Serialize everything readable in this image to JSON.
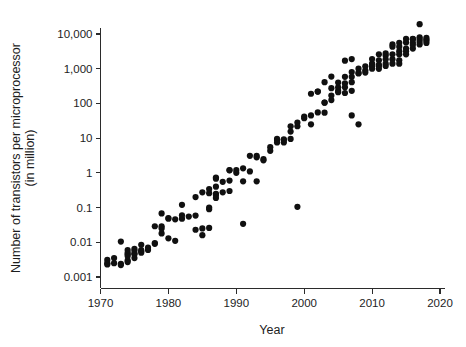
{
  "chart_data": {
    "type": "scatter",
    "title": "",
    "xlabel": "Year",
    "ylabel_line1": "Number of transistors per microprocessor",
    "ylabel_line2": "(in million)",
    "xlim": [
      1970,
      2020
    ],
    "ylim": [
      0.001,
      10000
    ],
    "yscale": "log",
    "xscale": "linear",
    "grid": false,
    "legend": null,
    "xticks": [
      1970,
      1980,
      1990,
      2000,
      2010,
      2020
    ],
    "xtick_labels": [
      "1970",
      "1980",
      "1990",
      "2000",
      "2010",
      "2020"
    ],
    "yticks": [
      0.001,
      0.01,
      0.1,
      1,
      10,
      100,
      1000,
      10000
    ],
    "ytick_labels": [
      "0.001",
      "0.01",
      "0.1",
      "1",
      "10",
      "100",
      "1,000",
      "10,000"
    ],
    "marker": "circle",
    "marker_color": "#101010",
    "marker_size": 3.1,
    "points": [
      [
        1971,
        0.0023
      ],
      [
        1971,
        0.0025
      ],
      [
        1971,
        0.0031
      ],
      [
        1972,
        0.0035
      ],
      [
        1972,
        0.0025
      ],
      [
        1973,
        0.0022
      ],
      [
        1973,
        0.0024
      ],
      [
        1973,
        0.0105
      ],
      [
        1974,
        0.0045
      ],
      [
        1974,
        0.005
      ],
      [
        1974,
        0.006
      ],
      [
        1974,
        0.003
      ],
      [
        1974,
        0.0027
      ],
      [
        1974,
        0.004
      ],
      [
        1975,
        0.0048
      ],
      [
        1975,
        0.0045
      ],
      [
        1975,
        0.0058
      ],
      [
        1975,
        0.0065
      ],
      [
        1975,
        0.0035
      ],
      [
        1976,
        0.0055
      ],
      [
        1976,
        0.0085
      ],
      [
        1976,
        0.006
      ],
      [
        1976,
        0.005
      ],
      [
        1977,
        0.006
      ],
      [
        1977,
        0.007
      ],
      [
        1978,
        0.009
      ],
      [
        1978,
        0.029
      ],
      [
        1978,
        0.0095
      ],
      [
        1979,
        0.029
      ],
      [
        1979,
        0.068
      ],
      [
        1979,
        0.018
      ],
      [
        1979,
        0.025
      ],
      [
        1980,
        0.048
      ],
      [
        1980,
        0.05
      ],
      [
        1980,
        0.013
      ],
      [
        1981,
        0.046
      ],
      [
        1981,
        0.011
      ],
      [
        1982,
        0.12
      ],
      [
        1982,
        0.048
      ],
      [
        1982,
        0.06
      ],
      [
        1983,
        0.055
      ],
      [
        1984,
        0.2
      ],
      [
        1984,
        0.059
      ],
      [
        1984,
        0.023
      ],
      [
        1985,
        0.275
      ],
      [
        1985,
        0.016
      ],
      [
        1985,
        0.025
      ],
      [
        1986,
        0.26
      ],
      [
        1986,
        0.34
      ],
      [
        1986,
        0.09
      ],
      [
        1986,
        0.1
      ],
      [
        1986,
        0.026
      ],
      [
        1987,
        0.4
      ],
      [
        1987,
        0.68
      ],
      [
        1987,
        0.73
      ],
      [
        1987,
        0.25
      ],
      [
        1987,
        0.23
      ],
      [
        1987,
        0.19
      ],
      [
        1988,
        0.275
      ],
      [
        1988,
        0.55
      ],
      [
        1989,
        1.18
      ],
      [
        1989,
        1.2
      ],
      [
        1989,
        0.6
      ],
      [
        1989,
        0.3
      ],
      [
        1990,
        1.0
      ],
      [
        1990,
        1.2
      ],
      [
        1991,
        1.35
      ],
      [
        1991,
        0.57
      ],
      [
        1991,
        0.034
      ],
      [
        1992,
        3.1
      ],
      [
        1992,
        1.1
      ],
      [
        1993,
        3.1
      ],
      [
        1993,
        2.8
      ],
      [
        1993,
        0.57
      ],
      [
        1994,
        2.5
      ],
      [
        1994,
        2.3
      ],
      [
        1995,
        5.5
      ],
      [
        1995,
        4.3
      ],
      [
        1996,
        8.8
      ],
      [
        1996,
        9.5
      ],
      [
        1996,
        7.5
      ],
      [
        1997,
        7.5
      ],
      [
        1997,
        8.8
      ],
      [
        1997,
        9.3
      ],
      [
        1998,
        9.5
      ],
      [
        1998,
        15.5
      ],
      [
        1998,
        22.0
      ],
      [
        1999,
        22.0
      ],
      [
        1999,
        28.0
      ],
      [
        1999,
        0.105
      ],
      [
        2000,
        42.0
      ],
      [
        2000,
        37.5
      ],
      [
        2001,
        45.0
      ],
      [
        2001,
        25.0
      ],
      [
        2001,
        190.0
      ],
      [
        2002,
        220.0
      ],
      [
        2002,
        55.0
      ],
      [
        2002,
        220.0
      ],
      [
        2003,
        410.0
      ],
      [
        2003,
        105.0
      ],
      [
        2003,
        106.0
      ],
      [
        2003,
        54.0
      ],
      [
        2004,
        275.0
      ],
      [
        2004,
        592.0
      ],
      [
        2004,
        125.0
      ],
      [
        2004,
        169.0
      ],
      [
        2005,
        230.0
      ],
      [
        2005,
        291.0
      ],
      [
        2005,
        400.0
      ],
      [
        2005,
        210.0
      ],
      [
        2006,
        1700.0
      ],
      [
        2006,
        582.0
      ],
      [
        2006,
        376.0
      ],
      [
        2006,
        291.0
      ],
      [
        2006,
        200.0
      ],
      [
        2007,
        1900.0
      ],
      [
        2007,
        805.0
      ],
      [
        2007,
        582.0
      ],
      [
        2007,
        410.0
      ],
      [
        2007,
        230.0
      ],
      [
        2007,
        45.0
      ],
      [
        2008,
        731.0
      ],
      [
        2008,
        758.0
      ],
      [
        2008,
        1000.0
      ],
      [
        2008,
        25.0
      ],
      [
        2009,
        904.0
      ],
      [
        2009,
        1170.0
      ],
      [
        2009,
        774.0
      ],
      [
        2010,
        1170.0
      ],
      [
        2010,
        1400.0
      ],
      [
        2010,
        1900.0
      ],
      [
        2010,
        1000.0
      ],
      [
        2010,
        1300.0
      ],
      [
        2011,
        2600.0
      ],
      [
        2011,
        1300.0
      ],
      [
        2011,
        1200.0
      ],
      [
        2011,
        995.0
      ],
      [
        2011,
        1750.0
      ],
      [
        2012,
        2400.0
      ],
      [
        2012,
        1400.0
      ],
      [
        2012,
        1200.0
      ],
      [
        2012,
        2750.0
      ],
      [
        2012,
        1860.0
      ],
      [
        2013,
        5000.0
      ],
      [
        2013,
        4310.0
      ],
      [
        2013,
        1860.0
      ],
      [
        2013,
        1400.0
      ],
      [
        2013,
        2600.0
      ],
      [
        2014,
        5560.0
      ],
      [
        2014,
        4300.0
      ],
      [
        2014,
        3200.0
      ],
      [
        2014,
        2600.0
      ],
      [
        2014,
        1750.0
      ],
      [
        2014,
        1400.0
      ],
      [
        2015,
        7200.0
      ],
      [
        2015,
        5700.0
      ],
      [
        2015,
        3200.0
      ],
      [
        2015,
        2600.0
      ],
      [
        2015,
        3800.0
      ],
      [
        2016,
        7200.0
      ],
      [
        2016,
        5570.0
      ],
      [
        2016,
        7100.0
      ],
      [
        2016,
        3800.0
      ],
      [
        2016,
        4800.0
      ],
      [
        2017,
        19200.0
      ],
      [
        2017,
        8000.0
      ],
      [
        2017,
        6000.0
      ],
      [
        2017,
        5000.0
      ],
      [
        2017,
        7100.0
      ],
      [
        2018,
        6900.0
      ],
      [
        2018,
        5500.0
      ],
      [
        2018,
        6300.0
      ],
      [
        2018,
        7800.0
      ]
    ]
  },
  "colors": {
    "marker": "#101010",
    "axis": "#2b2b2b",
    "text": "#1d1d1d",
    "background": "#ffffff"
  }
}
